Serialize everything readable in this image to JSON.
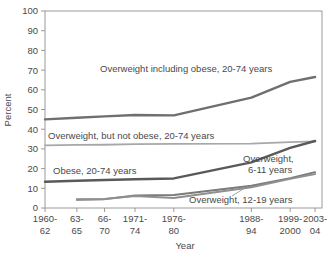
{
  "chart_data": {
    "type": "line",
    "title": "",
    "xlabel": "Year",
    "ylabel": "Percent",
    "ylim": [
      0,
      100
    ],
    "ytick_step": 10,
    "grid": false,
    "legend_position": "inline-annotations",
    "categories": [
      "1960-62",
      "63-65",
      "66-70",
      "1971-74",
      "1976-80",
      "1988-94",
      "1999-2000",
      "2003-04"
    ],
    "category_lines": [
      [
        "1960-",
        "62"
      ],
      [
        "63-",
        "65"
      ],
      [
        "66-",
        "70"
      ],
      [
        "1971-",
        "74"
      ],
      [
        "1976-",
        "80"
      ],
      [
        "1988-",
        "94"
      ],
      [
        "1999-",
        "2000"
      ],
      [
        "2003-",
        "04"
      ]
    ],
    "series": [
      {
        "name": "Overweight including obese, 20-74 years",
        "color": "#6f6f6f",
        "width": 2.4,
        "values": [
          45,
          45.8,
          46.5,
          47.2,
          47,
          56,
          64,
          66.5
        ]
      },
      {
        "name": "Overweight, but not obese, 20-74 years",
        "color": "#a8a8a8",
        "width": 1.8,
        "values": [
          31.8,
          32,
          32.1,
          32.4,
          32.5,
          32.7,
          33.4,
          33.8
        ]
      },
      {
        "name": "Obese, 20-74 years",
        "color": "#595959",
        "width": 2.4,
        "values": [
          13.3,
          13.8,
          14.2,
          14.6,
          15,
          23.2,
          30.5,
          34
        ]
      },
      {
        "name": "Overweight, 6-11 years",
        "color": "#7a7a7a",
        "width": 2.0,
        "values": [
          null,
          4.2,
          4.5,
          6.4,
          6.6,
          11.3,
          15.1,
          18.2
        ]
      },
      {
        "name": "Overweight, 12-19 years",
        "color": "#8f8f8f",
        "width": 2.0,
        "values": [
          null,
          4.5,
          4.6,
          6.1,
          5.1,
          10.5,
          14.8,
          17.2
        ]
      }
    ],
    "annotations": [
      {
        "id": "ann-overweight-including-obese",
        "text": "Overweight including obese, 20-74 years",
        "x": 100,
        "y": 72
      },
      {
        "id": "ann-overweight-not-obese",
        "text": "Overweight, but not obese, 20-74 years",
        "x": 48,
        "y": 139
      },
      {
        "id": "ann-obese",
        "text": "Obese, 20-74 years",
        "x": 53,
        "y": 174
      },
      {
        "id": "ann-overweight-6-11-line1",
        "text": "Overweight,",
        "x": 243,
        "y": 162
      },
      {
        "id": "ann-overweight-6-11-line2",
        "text": "6-11 years",
        "x": 248,
        "y": 173
      },
      {
        "id": "ann-overweight-12-19",
        "text": "Overweight, 12-19 years",
        "x": 189,
        "y": 203
      }
    ],
    "ytick_labels": [
      "0",
      "10",
      "20",
      "30",
      "40",
      "50",
      "60",
      "70",
      "80",
      "90",
      "100"
    ]
  }
}
